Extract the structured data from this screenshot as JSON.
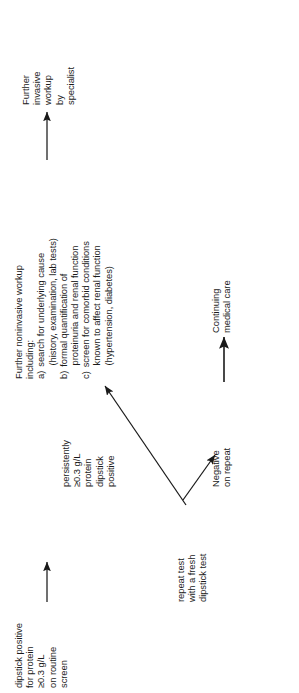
{
  "diagram": {
    "orientation": "rotated-90-ccw",
    "ink_color": "#1a1a1a",
    "background": "#ffffff",
    "nodes": {
      "screen": {
        "name": "initial-screen",
        "lines": [
          "dipstick positive",
          "for protein",
          "≥0.3 g/L",
          "on routine",
          "screen"
        ]
      },
      "repeat": {
        "name": "repeat-test",
        "lines": [
          "repeat test",
          "with a fresh",
          "dipstick test"
        ]
      },
      "persistent": {
        "name": "persistently-positive",
        "lines": [
          "persistently",
          "≥0.3 g/L",
          "protein",
          "dipstick",
          "positive"
        ]
      },
      "negative": {
        "name": "negative-on-repeat",
        "lines": [
          "Negative",
          "on repeat"
        ]
      },
      "continuing": {
        "name": "continuing-medical-care",
        "lines": [
          "Continuing",
          "medical care"
        ]
      },
      "workup": {
        "name": "further-noninvasive-workup",
        "heading": "Further noninvasive workup",
        "subheading": "including:",
        "items": [
          {
            "marker": "a)",
            "text": "search for underlying cause"
          },
          {
            "marker": "",
            "text": "(history, examination, lab tests)"
          },
          {
            "marker": "b)",
            "text": "formal quantification of"
          },
          {
            "marker": "",
            "text": "proteinuria and renal function"
          },
          {
            "marker": "c)",
            "text": "screen for comorbid conditions"
          },
          {
            "marker": "",
            "text": "known to affect renal function"
          },
          {
            "marker": "",
            "text": "(hypertension, diabetes)"
          }
        ]
      },
      "invasive": {
        "name": "further-invasive-workup",
        "lines": [
          "Further",
          "invasive",
          "workup",
          "by",
          "specialist"
        ]
      }
    },
    "edges": [
      {
        "name": "edge-screen-to-repeat",
        "label": ""
      },
      {
        "name": "edge-repeat-to-persistent-workup",
        "label": ""
      },
      {
        "name": "edge-repeat-to-negative",
        "label": ""
      },
      {
        "name": "edge-negative-to-continuing",
        "label": ""
      },
      {
        "name": "edge-workup-to-invasive",
        "label": ""
      }
    ]
  }
}
